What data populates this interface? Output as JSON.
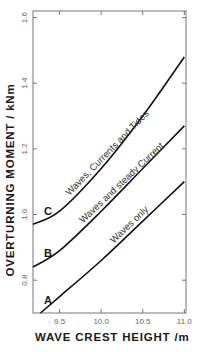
{
  "chart_data": {
    "type": "line",
    "title": "",
    "xlabel": "WAVE CREST HEIGHT /m",
    "ylabel": "OVERTURNING MOMENT / kNm",
    "xlim": [
      9.18,
      11.02
    ],
    "ylim": [
      0.7,
      1.62
    ],
    "x_ticks": [
      9.5,
      10.0,
      10.5,
      11.0
    ],
    "x_tick_labels": [
      "9.5",
      "10.0",
      "10.5",
      "11.0"
    ],
    "y_ticks": [
      0.8,
      1.0,
      1.2,
      1.4,
      1.6
    ],
    "y_tick_labels": [
      "0.8",
      "1.0",
      "1.2",
      "1.4",
      "1.6"
    ],
    "grid": false,
    "legend": "none (inline curve labels)",
    "series": [
      {
        "name": "Waves only",
        "letter": "A",
        "x": [
          9.27,
          9.5,
          10.0,
          10.5,
          11.0
        ],
        "values": [
          0.7,
          0.75,
          0.86,
          0.98,
          1.1
        ]
      },
      {
        "name": "Waves and steady Current",
        "letter": "B",
        "x": [
          9.18,
          9.5,
          10.0,
          10.5,
          11.0
        ],
        "values": [
          0.84,
          0.89,
          1.01,
          1.14,
          1.27
        ]
      },
      {
        "name": "Waves, Currents and Tides",
        "letter": "C",
        "x": [
          9.18,
          9.5,
          10.0,
          10.5,
          11.0
        ],
        "values": [
          0.97,
          1.01,
          1.14,
          1.3,
          1.48
        ]
      }
    ]
  },
  "labels": {
    "ylabel": "OVERTURNING MOMENT / kNm",
    "xlabel": "WAVE CREST HEIGHT /m"
  },
  "colors": {
    "axis": "#777777",
    "curve": "#111111",
    "text": "#1a1a1a",
    "tick_text": "#666666"
  }
}
